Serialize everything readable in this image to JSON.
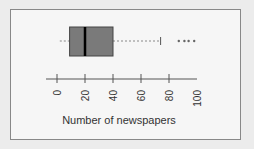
{
  "chart_data": {
    "type": "boxplot",
    "orientation": "horizontal",
    "title": "",
    "xlabel": "Number of newspapers",
    "ylabel": "",
    "xlim": [
      0,
      100
    ],
    "ticks": [
      0,
      20,
      40,
      60,
      80,
      100
    ],
    "tick_labels": [
      "0",
      "20",
      "40",
      "60",
      "80",
      "100"
    ],
    "grid": false,
    "stats": {
      "whisker_low": 2,
      "q1": 9,
      "median": 20,
      "q3": 40,
      "whisker_high": 74
    },
    "outliers": [
      87,
      91,
      94,
      98
    ],
    "box_color": "#7a7a7a",
    "median_color": "#000000"
  }
}
